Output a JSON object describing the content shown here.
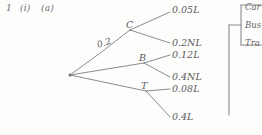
{
  "page": {
    "background_color": "#fdfdfc",
    "ink_color": "#6b6b70",
    "width": 262,
    "height": 135
  },
  "header": {
    "question_number": "1",
    "part_roman": "(i)",
    "part_letter": "(a)"
  },
  "tree": {
    "root": {
      "x": 70,
      "y": 75
    },
    "nodes": [
      {
        "id": "C",
        "label": "C",
        "x": 130,
        "y": 30,
        "label_x": 126,
        "label_y": 19
      },
      {
        "id": "B",
        "label": "B",
        "x": 144,
        "y": 63,
        "label_x": 139,
        "label_y": 52
      },
      {
        "id": "T",
        "label": "T",
        "x": 146,
        "y": 91,
        "label_x": 141,
        "label_y": 80
      }
    ],
    "edge_labels": [
      {
        "text": "0.2",
        "x": 99,
        "y": 48,
        "for_edge": "root-to-C"
      }
    ],
    "leaves": [
      {
        "text": "0.05L",
        "x": 172,
        "y": 6,
        "from": "C"
      },
      {
        "text": "0.2NL",
        "x": 172,
        "y": 39,
        "from": "C"
      },
      {
        "text": "0.12L",
        "x": 172,
        "y": 51,
        "from": "B"
      },
      {
        "text": "0.4NL",
        "x": 172,
        "y": 73,
        "from": "B"
      },
      {
        "text": "0.08L",
        "x": 172,
        "y": 85,
        "from": "T"
      },
      {
        "text": "0.4L",
        "x": 172,
        "y": 113,
        "from": "T"
      }
    ]
  },
  "side_menu": {
    "items": [
      {
        "label": "Car"
      },
      {
        "label": "Bus"
      },
      {
        "label": "Tra"
      }
    ]
  }
}
